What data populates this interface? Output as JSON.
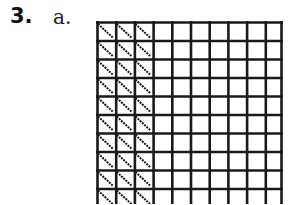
{
  "problem": {
    "number": "3.",
    "part": "a."
  },
  "grid": {
    "columns": 10,
    "rows_visible": 10,
    "shaded_columns": 3,
    "shading": "diagonal-hatch",
    "line_color": "#1a1a1a"
  }
}
